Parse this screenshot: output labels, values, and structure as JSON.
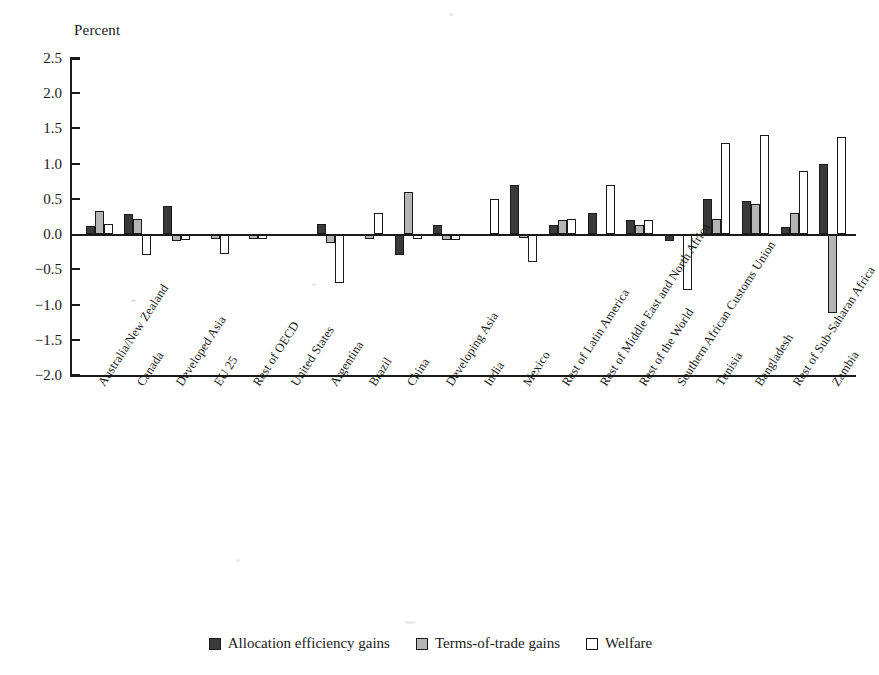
{
  "chart_data": {
    "type": "bar",
    "title": "",
    "subtitle": "",
    "ylabel": "Percent",
    "xlabel": "",
    "ylim": [
      -2.0,
      2.5
    ],
    "ytick_labels": [
      "2.5",
      "2.0",
      "1.5",
      "1.0",
      "0.5",
      "0.0",
      "−0.5",
      "−1.0",
      "−1.5",
      "−2.0"
    ],
    "ytick_values": [
      2.5,
      2.0,
      1.5,
      1.0,
      0.5,
      0.0,
      -0.5,
      -1.0,
      -1.5,
      -2.0
    ],
    "grid": false,
    "legend_position": "bottom",
    "categories": [
      "Australia/New Zealand",
      "Canada",
      "Developed Asia",
      "EU 25",
      "Rest of OECD",
      "United States",
      "Argentina",
      "Brazil",
      "China",
      "Developing Asia",
      "India",
      "Mexico",
      "Rest of Latin America",
      "Rest of Middle East and North Africa",
      "Rest of the World",
      "Southern African Customs Union",
      "Tunisia",
      "Bangladesh",
      "Rest of Sub-Saharan Africa",
      "Zambia"
    ],
    "series": [
      {
        "name": "Allocation efficiency gains",
        "color": "#3a3a3a",
        "values": [
          0.12,
          0.28,
          0.4,
          0.0,
          0.0,
          0.0,
          0.15,
          0.0,
          -0.3,
          0.13,
          0.0,
          0.7,
          0.13,
          0.3,
          0.2,
          -0.1,
          0.5,
          0.47,
          0.1,
          1.0
        ]
      },
      {
        "name": "Terms-of-trade gains",
        "color": "#b5b5b5",
        "values": [
          0.33,
          0.22,
          -0.1,
          -0.07,
          -0.07,
          0.0,
          -0.13,
          -0.07,
          0.6,
          -0.08,
          0.0,
          -0.06,
          0.2,
          0.0,
          0.13,
          0.0,
          0.21,
          0.43,
          0.3,
          -1.12
        ]
      },
      {
        "name": "Welfare",
        "color": "#ffffff",
        "values": [
          0.14,
          -0.3,
          -0.09,
          -0.28,
          -0.07,
          0.0,
          -0.7,
          0.3,
          -0.07,
          -0.08,
          0.5,
          -0.4,
          0.22,
          0.7,
          0.2,
          -0.8,
          1.3,
          1.4,
          0.9,
          1.38
        ]
      }
    ]
  },
  "legend": {
    "items": [
      {
        "label": "Allocation efficiency gains"
      },
      {
        "label": "Terms-of-trade gains"
      },
      {
        "label": "Welfare"
      }
    ]
  }
}
